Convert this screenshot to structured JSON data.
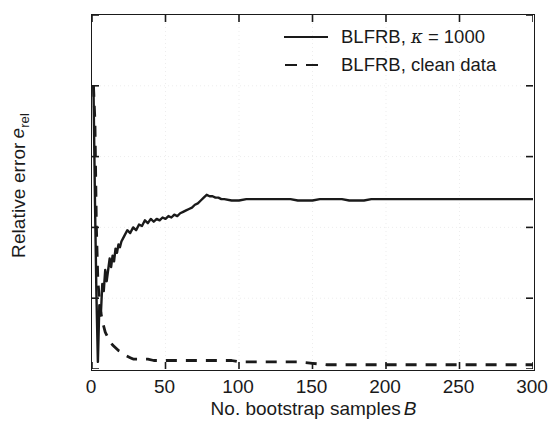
{
  "chart_data": {
    "type": "line",
    "title": "",
    "xlabel": "No. bootstrap samples B",
    "xlabel_prefix": "No. bootstrap samples",
    "xlabel_italic": "B",
    "ylabel": "Relative error e_rel",
    "ylabel_prefix": "Relative error",
    "ylabel_italic": "e",
    "ylabel_subscript": "rel",
    "xlim": [
      0,
      300
    ],
    "ylim": [
      0,
      0.25
    ],
    "xticks": [
      0,
      50,
      100,
      150,
      200,
      250,
      300
    ],
    "xtick_labels": [
      "0",
      "50",
      "100",
      "150",
      "200",
      "250",
      "300"
    ],
    "yticks": [
      0,
      0.05,
      0.1,
      0.15,
      0.2,
      0.25
    ],
    "ytick_labels": [
      "0",
      "0.05",
      "0.1",
      "0.15",
      "0.2",
      "0.25"
    ],
    "grid": true,
    "grid_style": "dotted",
    "grid_color": "#ededed",
    "legend_position": "upper right",
    "axis_color": "#1a1a1a",
    "series": [
      {
        "name": "BLFRB, κ = 1000",
        "name_prefix": "BLFRB,",
        "name_symbol": "κ",
        "name_suffix": "= 1000",
        "style": "solid",
        "color": "#1a1a1a",
        "x": [
          1,
          2,
          3,
          4,
          5,
          6,
          7,
          8,
          9,
          10,
          11,
          12,
          13,
          14,
          15,
          16,
          17,
          18,
          19,
          20,
          22,
          24,
          26,
          28,
          30,
          32,
          34,
          36,
          38,
          40,
          42,
          44,
          46,
          48,
          50,
          52,
          54,
          56,
          58,
          60,
          62,
          64,
          66,
          68,
          70,
          72,
          74,
          76,
          78,
          80,
          82,
          84,
          86,
          88,
          90,
          95,
          100,
          105,
          110,
          115,
          120,
          125,
          130,
          135,
          140,
          145,
          150,
          155,
          160,
          165,
          170,
          175,
          180,
          185,
          190,
          195,
          200,
          205,
          210,
          215,
          220,
          225,
          230,
          235,
          240,
          245,
          250,
          255,
          260,
          265,
          270,
          275,
          280,
          285,
          290,
          295,
          300
        ],
        "y": [
          0.2,
          0.12,
          0.053,
          0.005,
          0.045,
          0.038,
          0.06,
          0.055,
          0.07,
          0.062,
          0.07,
          0.078,
          0.072,
          0.08,
          0.076,
          0.085,
          0.082,
          0.088,
          0.086,
          0.09,
          0.094,
          0.098,
          0.096,
          0.1,
          0.098,
          0.102,
          0.101,
          0.105,
          0.103,
          0.106,
          0.104,
          0.106,
          0.105,
          0.107,
          0.106,
          0.108,
          0.107,
          0.109,
          0.108,
          0.11,
          0.111,
          0.112,
          0.113,
          0.114,
          0.116,
          0.117,
          0.119,
          0.121,
          0.123,
          0.122,
          0.122,
          0.121,
          0.121,
          0.12,
          0.12,
          0.119,
          0.119,
          0.12,
          0.12,
          0.12,
          0.12,
          0.12,
          0.12,
          0.12,
          0.119,
          0.119,
          0.119,
          0.12,
          0.12,
          0.12,
          0.12,
          0.119,
          0.119,
          0.119,
          0.12,
          0.12,
          0.12,
          0.12,
          0.12,
          0.12,
          0.12,
          0.12,
          0.12,
          0.12,
          0.12,
          0.12,
          0.12,
          0.12,
          0.12,
          0.12,
          0.12,
          0.12,
          0.12,
          0.12,
          0.12,
          0.12,
          0.12
        ]
      },
      {
        "name": "BLFRB, clean data",
        "style": "dashed",
        "color": "#1a1a1a",
        "x": [
          1,
          2,
          3,
          4,
          5,
          6,
          7,
          8,
          9,
          10,
          12,
          14,
          16,
          18,
          20,
          22,
          24,
          26,
          28,
          30,
          34,
          38,
          42,
          46,
          50,
          55,
          60,
          65,
          70,
          75,
          80,
          85,
          90,
          95,
          100,
          110,
          120,
          130,
          140,
          150,
          160,
          170,
          180,
          190,
          200,
          210,
          220,
          230,
          240,
          250,
          260,
          270,
          280,
          290,
          300
        ],
        "y": [
          0.2,
          0.175,
          0.1,
          0.062,
          0.05,
          0.04,
          0.034,
          0.03,
          0.026,
          0.024,
          0.02,
          0.017,
          0.015,
          0.013,
          0.012,
          0.01,
          0.009,
          0.008,
          0.007,
          0.007,
          0.007,
          0.007,
          0.006,
          0.006,
          0.006,
          0.006,
          0.006,
          0.006,
          0.006,
          0.006,
          0.006,
          0.006,
          0.006,
          0.006,
          0.005,
          0.005,
          0.005,
          0.005,
          0.005,
          0.004,
          0.003,
          0.003,
          0.003,
          0.003,
          0.003,
          0.003,
          0.003,
          0.003,
          0.003,
          0.003,
          0.003,
          0.003,
          0.003,
          0.003,
          0.003
        ]
      }
    ]
  },
  "legend": {
    "entries": [
      {
        "prefix": "BLFRB,",
        "symbol": "κ",
        "suffix": "= 1000",
        "style": "solid"
      },
      {
        "prefix": "BLFRB, clean data",
        "symbol": "",
        "suffix": "",
        "style": "dashed"
      }
    ]
  }
}
